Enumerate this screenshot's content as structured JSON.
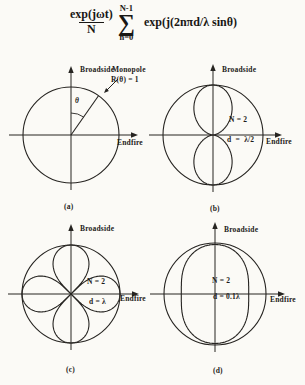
{
  "page": {
    "background": "#fbfaf6",
    "ink": "#262421"
  },
  "formula": {
    "numerator": "exp(jωt)",
    "denominator": "N",
    "sum_upper": "N-1",
    "sum_symbol": "∑",
    "sum_lower": "n=0",
    "rhs": "exp(j(2nπd/λ sinθ)"
  },
  "chart_data": [
    {
      "id": "a",
      "type": "polar",
      "caption": "(a)",
      "axis_labels": {
        "vertical": "Broadside",
        "horizontal": "Endfire"
      },
      "pattern": {
        "kind": "unit-circle",
        "r": 1.0,
        "description": "omnidirectional monopole pattern, R(θ) = 1 for all θ"
      },
      "annotations": {
        "callout": [
          "Monopole",
          "R(θ) = 1"
        ],
        "angle_label": "θ",
        "ray_angle_from_broadside_deg": 35
      }
    },
    {
      "id": "b",
      "type": "polar",
      "caption": "(b)",
      "axis_labels": {
        "vertical": "Broadside",
        "horizontal": "Endfire"
      },
      "inline_labels": {
        "elements": "N = 2",
        "spacing": "d  =  λ/2"
      },
      "pattern": {
        "kind": "array-factor",
        "formula": "R(θ) = |cos(π·(d/λ)·sinθ)|",
        "d_over_lambda": 0.5,
        "shape_exponent": 0.85,
        "key_values": {
          "broadside_r": 1.0,
          "endfire_r": 0.0,
          "null_directions": "endfire (horizontal)"
        }
      }
    },
    {
      "id": "c",
      "type": "polar",
      "caption": "(c)",
      "axis_labels": {
        "vertical": "Broadside",
        "horizontal": "Endfire"
      },
      "inline_labels": {
        "elements": "N = 2",
        "spacing": "d = λ"
      },
      "pattern": {
        "kind": "four-petal-rose",
        "formula": "|cos(2φ)|^0.45 (schematic four-lobe pattern for d = λ)",
        "exponent": 0.45,
        "key_values": {
          "broadside_r": 1.0,
          "endfire_r": 1.0,
          "null_angles_deg": [
            45,
            135,
            225,
            315
          ]
        }
      }
    },
    {
      "id": "d",
      "type": "polar",
      "caption": "(d)",
      "axis_labels": {
        "vertical": "Broadside",
        "horizontal": "Endfire"
      },
      "inline_labels": {
        "elements": "N = 2",
        "spacing": "d = 0.1λ"
      },
      "pattern": {
        "kind": "pinched-circle",
        "formula": "nearly omnidirectional, slight dip toward endfire for d = 0.1λ",
        "r_broadside": 0.97,
        "r_endfire": 0.66,
        "pinch_exponent": 2.2
      }
    }
  ]
}
